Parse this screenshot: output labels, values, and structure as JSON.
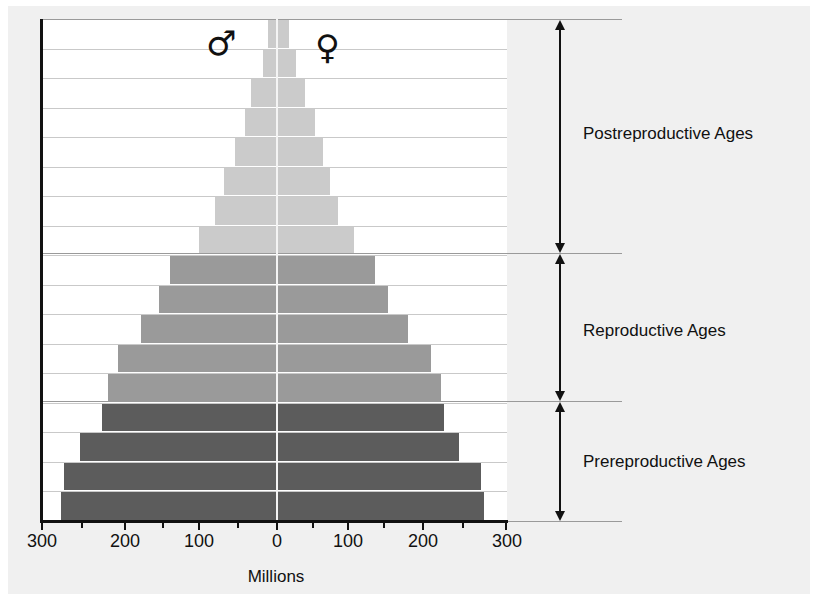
{
  "chart_data": {
    "type": "bar",
    "subtype": "population-pyramid",
    "title": "",
    "xlabel": "Millions",
    "ylabel": "",
    "xlim": [
      -300,
      300
    ],
    "x_tick_labels": [
      "300",
      "200",
      "100",
      "0",
      "100",
      "200",
      "300"
    ],
    "x_minor_ticks": [
      250,
      150,
      50
    ],
    "grid": true,
    "legend": {
      "male_symbol": "♂",
      "female_symbol": "♀"
    },
    "rows_top_to_bottom": 17,
    "series": [
      {
        "name": "Male",
        "side": "left",
        "values": [
          11,
          18,
          33,
          41,
          54,
          68,
          79,
          100,
          137,
          151,
          174,
          203,
          216,
          223,
          252,
          272,
          276
        ]
      },
      {
        "name": "Female",
        "side": "right",
        "values": [
          16,
          25,
          37,
          50,
          60,
          69,
          80,
          100,
          128,
          145,
          171,
          201,
          214,
          218,
          237,
          266,
          270
        ]
      }
    ],
    "groups": [
      {
        "name": "Postreproductive Ages",
        "rows": [
          0,
          7
        ],
        "color": "#cbcbcb"
      },
      {
        "name": "Reproductive Ages",
        "rows": [
          8,
          12
        ],
        "color": "#9a9a9a"
      },
      {
        "name": "Prereproductive Ages",
        "rows": [
          13,
          16
        ],
        "color": "#5c5c5c"
      }
    ]
  },
  "axis": {
    "xlabel": "Millions",
    "ticks": [
      {
        "label": "300",
        "x": 42
      },
      {
        "label": "200",
        "x": 125
      },
      {
        "label": "100",
        "x": 199
      },
      {
        "label": "0",
        "x": 277
      },
      {
        "label": "100",
        "x": 348
      },
      {
        "label": "200",
        "x": 423
      },
      {
        "label": "300",
        "x": 507
      }
    ]
  },
  "symbols": {
    "male": "♂",
    "female": "♀"
  },
  "regions": {
    "post": "Postreproductive Ages",
    "repro": "Reproductive Ages",
    "pre": "Prereproductive Ages"
  }
}
